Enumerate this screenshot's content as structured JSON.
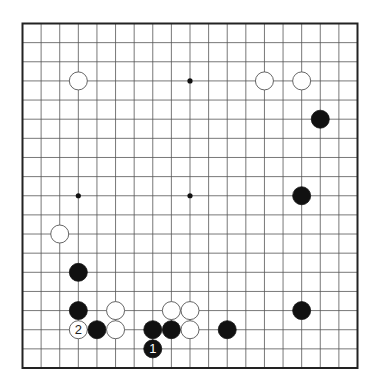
{
  "diagram": {
    "type": "go-board",
    "board_size": 19,
    "hoshi": [
      [
        3,
        3
      ],
      [
        9,
        3
      ],
      [
        15,
        3
      ],
      [
        3,
        9
      ],
      [
        9,
        9
      ],
      [
        15,
        9
      ],
      [
        3,
        15
      ],
      [
        9,
        15
      ],
      [
        15,
        15
      ]
    ],
    "stones": [
      {
        "color": "white",
        "col": 3,
        "row": 3,
        "label": ""
      },
      {
        "color": "white",
        "col": 13,
        "row": 3,
        "label": ""
      },
      {
        "color": "white",
        "col": 15,
        "row": 3,
        "label": ""
      },
      {
        "color": "black",
        "col": 16,
        "row": 5,
        "label": ""
      },
      {
        "color": "black",
        "col": 15,
        "row": 9,
        "label": ""
      },
      {
        "color": "white",
        "col": 2,
        "row": 11,
        "label": ""
      },
      {
        "color": "black",
        "col": 3,
        "row": 13,
        "label": ""
      },
      {
        "color": "black",
        "col": 3,
        "row": 15,
        "label": ""
      },
      {
        "color": "white",
        "col": 5,
        "row": 15,
        "label": ""
      },
      {
        "color": "white",
        "col": 8,
        "row": 15,
        "label": ""
      },
      {
        "color": "white",
        "col": 9,
        "row": 15,
        "label": ""
      },
      {
        "color": "black",
        "col": 15,
        "row": 15,
        "label": ""
      },
      {
        "color": "white",
        "col": 3,
        "row": 16,
        "label": "2"
      },
      {
        "color": "black",
        "col": 4,
        "row": 16,
        "label": ""
      },
      {
        "color": "white",
        "col": 5,
        "row": 16,
        "label": ""
      },
      {
        "color": "black",
        "col": 7,
        "row": 16,
        "label": ""
      },
      {
        "color": "black",
        "col": 8,
        "row": 16,
        "label": ""
      },
      {
        "color": "white",
        "col": 9,
        "row": 16,
        "label": ""
      },
      {
        "color": "black",
        "col": 11,
        "row": 16,
        "label": ""
      },
      {
        "color": "black",
        "col": 7,
        "row": 17,
        "label": "1"
      }
    ]
  }
}
